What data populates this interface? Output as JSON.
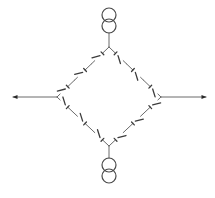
{
  "diagram": {
    "type": "single-line electrical ring network",
    "colors": {
      "line": "#6a6a6a",
      "blade": "#3c3c3c",
      "coil": "#4a4a4a",
      "arrow": "#2a2a2a",
      "background": "#ffffff"
    },
    "nodes": {
      "top": {
        "x": 109,
        "y": 47
      },
      "left": {
        "x": 57,
        "y": 97
      },
      "right": {
        "x": 161,
        "y": 97
      },
      "bottom": {
        "x": 109,
        "y": 146
      }
    },
    "transformers": [
      {
        "id": "transformer-top",
        "circles": [
          {
            "cx": 109,
            "cy": 15,
            "r": 7
          },
          {
            "cx": 109,
            "cy": 26,
            "r": 7
          }
        ],
        "stem": [
          109,
          33,
          109,
          47
        ]
      },
      {
        "id": "transformer-bottom",
        "circles": [
          {
            "cx": 109,
            "cy": 165,
            "r": 7
          },
          {
            "cx": 109,
            "cy": 176,
            "r": 7
          }
        ],
        "stem": [
          109,
          146,
          109,
          158
        ]
      }
    ],
    "feeders": [
      {
        "id": "feeder-left",
        "from": [
          57,
          97
        ],
        "to": [
          13,
          97
        ],
        "direction": "left"
      },
      {
        "id": "feeder-right",
        "from": [
          161,
          97
        ],
        "to": [
          206,
          97
        ],
        "direction": "right"
      }
    ],
    "edges": [
      {
        "id": "edge-top-left",
        "from": "top",
        "to": "left",
        "switch_count": 3
      },
      {
        "id": "edge-top-right",
        "from": "top",
        "to": "right",
        "switch_count": 3
      },
      {
        "id": "edge-bottom-left",
        "from": "bottom",
        "to": "left",
        "switch_count": 3
      },
      {
        "id": "edge-bottom-right",
        "from": "bottom",
        "to": "right",
        "switch_count": 3
      }
    ]
  }
}
